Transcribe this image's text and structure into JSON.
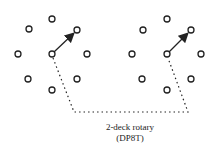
{
  "diagram": {
    "caption_line1": "2-deck rotary",
    "caption_line2": "(DP8T)",
    "colors": {
      "stroke": "#222222",
      "background": "#ffffff"
    },
    "decks": [
      {
        "name": "deck-1",
        "center": [
          52,
          54
        ],
        "contacts": [
          [
            52,
            19
          ],
          [
            29,
            29
          ],
          [
            77,
            30
          ],
          [
            18,
            54
          ],
          [
            87,
            54
          ],
          [
            28,
            79
          ],
          [
            77,
            79
          ],
          [
            52,
            90
          ]
        ],
        "arrow_to": [
          77,
          30
        ]
      },
      {
        "name": "deck-2",
        "center": [
          167,
          54
        ],
        "contacts": [
          [
            167,
            19
          ],
          [
            143,
            30
          ],
          [
            191,
            30
          ],
          [
            132,
            54
          ],
          [
            201,
            54
          ],
          [
            142,
            79
          ],
          [
            191,
            79
          ],
          [
            167,
            90
          ]
        ],
        "arrow_to": [
          191,
          30
        ]
      }
    ],
    "linkage": "dotted mechanical linkage between deck rotors"
  }
}
